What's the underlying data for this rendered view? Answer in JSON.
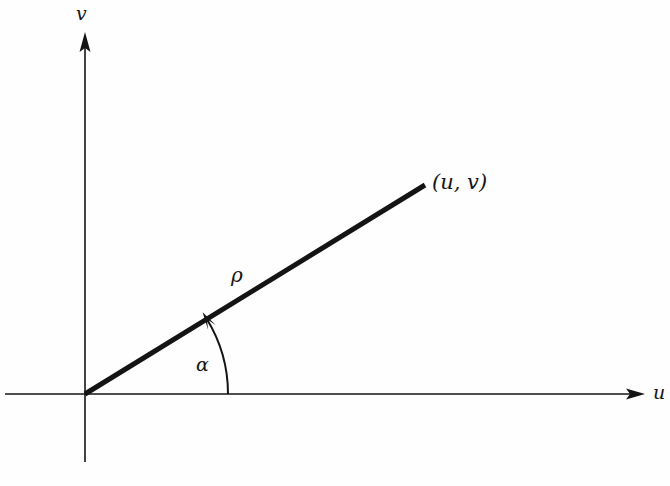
{
  "figure": {
    "background_color": "#fefefe",
    "stroke_color": "#141414",
    "width": 670,
    "height": 486
  },
  "axes": {
    "horizontal": {
      "name": "u-axis",
      "label": "u",
      "x_start": 5,
      "x_end": 645,
      "y": 394,
      "arrow_end": "right"
    },
    "vertical": {
      "name": "v-axis",
      "label": "v",
      "x": 85,
      "y_start": 462,
      "y_end": 32,
      "arrow_end": "up"
    },
    "origin": {
      "x": 85,
      "y": 394
    }
  },
  "ray": {
    "name": "radius-vector",
    "label": "ρ",
    "from": {
      "x": 85,
      "y": 394
    },
    "to": {
      "x": 425,
      "y": 185
    },
    "stroke_width": 5
  },
  "point": {
    "label": "(u, v)",
    "x": 425,
    "y": 185
  },
  "angle": {
    "label": "α",
    "arc_radius": 143,
    "start_degrees": 0,
    "end_degrees": 31.6,
    "arrow_at": "ray-side"
  },
  "chart_data": {
    "type": "scatter",
    "title": "",
    "xlabel": "u",
    "ylabel": "v",
    "annotations": [
      {
        "text": "(u, v)",
        "kind": "point-label"
      },
      {
        "text": "ρ",
        "kind": "length-label"
      },
      {
        "text": "α",
        "kind": "angle-label"
      }
    ],
    "series": [
      {
        "name": "radius-vector",
        "x": [
          0,
          340
        ],
        "y": [
          0,
          209
        ]
      }
    ],
    "grid": false,
    "legend": null
  }
}
